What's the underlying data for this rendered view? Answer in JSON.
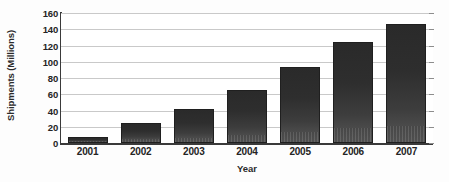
{
  "chart_data": {
    "type": "bar",
    "title": "",
    "xlabel": "Year",
    "ylabel": "Shipments (Millions)",
    "categories": [
      "2001",
      "2002",
      "2003",
      "2004",
      "2005",
      "2006",
      "2007"
    ],
    "values": [
      7,
      25,
      42,
      65,
      94,
      124,
      146
    ],
    "ylim": [
      0,
      160
    ],
    "yticks": [
      0,
      20,
      40,
      60,
      80,
      100,
      120,
      140,
      160
    ],
    "ytick_labels": [
      "0",
      "20",
      "40",
      "60",
      "80",
      "100",
      "120",
      "140",
      "160"
    ],
    "grid": true,
    "legend": "none",
    "series": [
      {
        "name": "Shipments",
        "values": [
          7,
          25,
          42,
          65,
          94,
          124,
          146
        ]
      }
    ],
    "bar_color": "#2e2e2e",
    "grid_color": "#c9c9c9",
    "axis_color": "#3a3a3a"
  }
}
